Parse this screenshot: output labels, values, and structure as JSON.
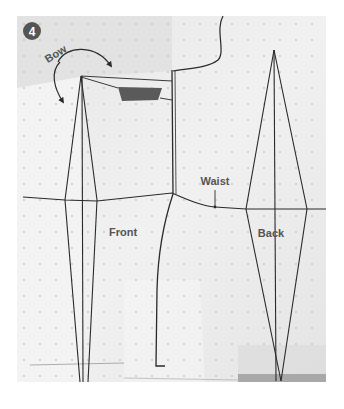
{
  "figure": {
    "step_number": "4",
    "labels": {
      "bow": "Bow",
      "waist": "Waist",
      "front": "Front",
      "back": "Back"
    },
    "colors": {
      "background": "#ffffff",
      "paper": "#ececec",
      "paper_light": "#f4f4f4",
      "line": "#2a2a2a",
      "tape": "#5a5a5a",
      "badge": "#555555",
      "label_text": "#555555",
      "dot": "#c8c8c8"
    }
  }
}
